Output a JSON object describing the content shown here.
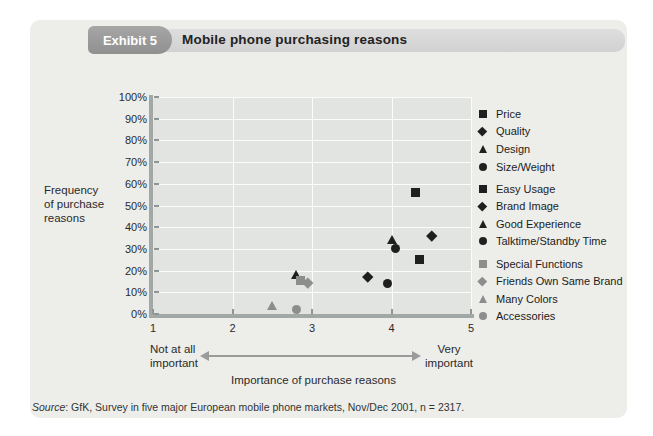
{
  "header": {
    "badge": "Exhibit 5",
    "title": "Mobile phone purchasing reasons"
  },
  "axes": {
    "y_label_lines": [
      "Frequency",
      "of purchase",
      "reasons"
    ],
    "left_annotation_lines": [
      "Not at all",
      "important"
    ],
    "right_annotation_lines": [
      "Very",
      "important"
    ],
    "axis_title": "Importance of purchase reasons"
  },
  "source": {
    "label": "Source",
    "text": ": GfK, Survey in five major European mobile phone markets, Nov/Dec 2001, n = 2317."
  },
  "colors": {
    "black_marker": "#1f1f1f",
    "gray_marker": "#8d8d8d",
    "plot_background": "#e2e4e1",
    "panel_background": "#edeeea",
    "axis_line": "#a2a8a5",
    "arrow": "#9b9b9b"
  },
  "chart_data": {
    "type": "scatter",
    "title": "Mobile phone purchasing reasons",
    "xlabel": "Importance of purchase reasons",
    "ylabel": "Frequency of purchase reasons",
    "xlim": [
      1,
      5
    ],
    "ylim": [
      0,
      100
    ],
    "x_ticks": [
      1,
      2,
      3,
      4,
      5
    ],
    "x_tick_labels": [
      "1",
      "2",
      "3",
      "4",
      "5"
    ],
    "y_ticks": [
      0,
      10,
      20,
      30,
      40,
      50,
      60,
      70,
      80,
      90,
      100
    ],
    "y_tick_labels": [
      "0%",
      "10%",
      "20%",
      "30%",
      "40%",
      "50%",
      "60%",
      "70%",
      "80%",
      "90%",
      "100%"
    ],
    "grid": true,
    "legend_position": "right",
    "series": [
      {
        "name": "Price",
        "marker": "square",
        "color": "#1f1f1f",
        "group": 1,
        "x": 4.3,
        "y": 56
      },
      {
        "name": "Quality",
        "marker": "diamond",
        "color": "#1f1f1f",
        "group": 1,
        "x": 4.5,
        "y": 36
      },
      {
        "name": "Design",
        "marker": "triangle",
        "color": "#1f1f1f",
        "group": 1,
        "x": 4.0,
        "y": 34
      },
      {
        "name": "Size/Weight",
        "marker": "circle",
        "color": "#1f1f1f",
        "group": 1,
        "x": 4.05,
        "y": 30
      },
      {
        "name": "Easy Usage",
        "marker": "square",
        "color": "#1f1f1f",
        "group": 2,
        "x": 4.35,
        "y": 25
      },
      {
        "name": "Brand Image",
        "marker": "diamond",
        "color": "#1f1f1f",
        "group": 2,
        "x": 3.7,
        "y": 17
      },
      {
        "name": "Good Experience",
        "marker": "triangle",
        "color": "#1f1f1f",
        "group": 2,
        "x": 2.8,
        "y": 18
      },
      {
        "name": "Talktime/Standby Time",
        "marker": "circle",
        "color": "#1f1f1f",
        "group": 2,
        "x": 3.95,
        "y": 14
      },
      {
        "name": "Special Functions",
        "marker": "square",
        "color": "#8d8d8d",
        "group": 3,
        "x": 2.85,
        "y": 15.5
      },
      {
        "name": "Friends Own Same Brand",
        "marker": "diamond",
        "color": "#8d8d8d",
        "group": 3,
        "x": 2.95,
        "y": 14.5
      },
      {
        "name": "Many Colors",
        "marker": "triangle",
        "color": "#8d8d8d",
        "group": 3,
        "x": 2.5,
        "y": 3.5
      },
      {
        "name": "Accessories",
        "marker": "circle",
        "color": "#8d8d8d",
        "group": 3,
        "x": 2.8,
        "y": 2
      }
    ]
  }
}
